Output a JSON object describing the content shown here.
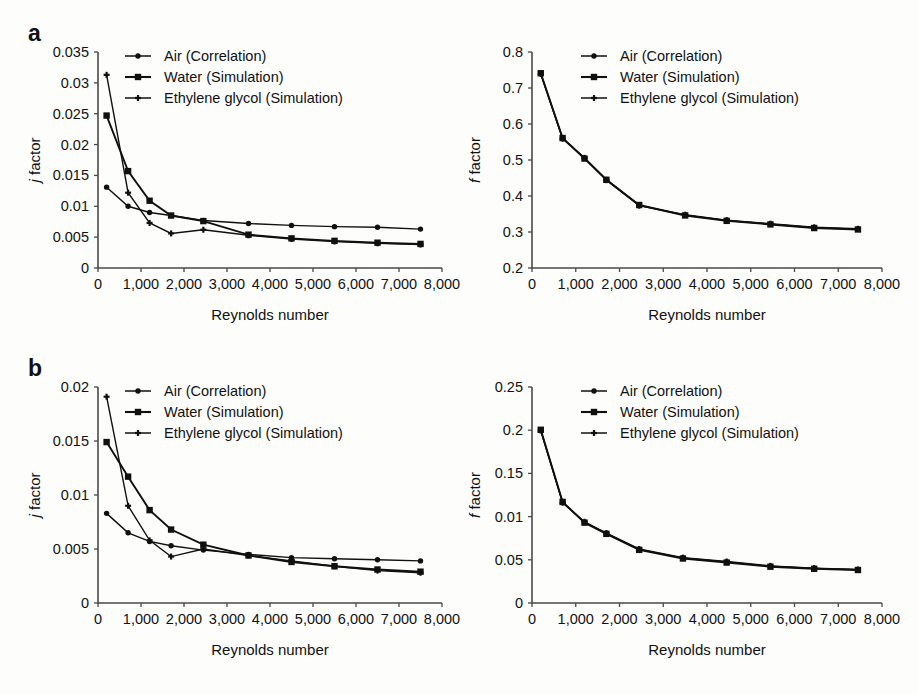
{
  "figure": {
    "background": "#fdfdfc",
    "ink_color": "#101010",
    "panels": [
      {
        "letter": "a",
        "charts": [
          "a_left",
          "a_right"
        ]
      },
      {
        "letter": "b",
        "charts": [
          "b_left",
          "b_right"
        ]
      }
    ]
  },
  "legend_labels": {
    "air": "Air (Correlation)",
    "water": "Water (Simulation)",
    "ethylene": "Ethylene glycol (Simulation)"
  },
  "axis_labels": {
    "x": "Reynolds number",
    "y_j_italic": "j",
    "y_j_rest": " factor",
    "y_f_italic": "f",
    "y_f_rest": " factor"
  },
  "chart_data": [
    {
      "id": "a_left",
      "panel": "a",
      "type": "line",
      "title": "",
      "xlabel": "Reynolds number",
      "ylabel": "j factor",
      "xlim": [
        0,
        8000
      ],
      "ylim": [
        0,
        0.035
      ],
      "xticks": [
        0,
        1000,
        2000,
        3000,
        4000,
        5000,
        6000,
        7000,
        8000
      ],
      "xticklabels": [
        "0",
        "1,000",
        "2,000",
        "3,000",
        "4,000",
        "5,000",
        "6,000",
        "7,000",
        "8,000"
      ],
      "yticks": [
        0,
        0.005,
        0.01,
        0.015,
        0.02,
        0.025,
        0.03,
        0.035
      ],
      "yticklabels": [
        "0",
        "0.005",
        "0.01",
        "0.015",
        "0.02",
        "0.025",
        "0.03",
        "0.035"
      ],
      "grid": false,
      "legend_position": "top-center",
      "x": [
        200,
        700,
        1200,
        1700,
        2450,
        3500,
        4500,
        5500,
        6500,
        7500
      ],
      "series": [
        {
          "name": "Air (Correlation)",
          "marker": "diamond",
          "values": [
            0.0131,
            0.01,
            0.009,
            0.0085,
            0.0077,
            0.0072,
            0.0069,
            0.0067,
            0.0066,
            0.0063
          ]
        },
        {
          "name": "Water (Simulation)",
          "marker": "square",
          "values": [
            0.0247,
            0.0157,
            0.0109,
            0.0085,
            0.0076,
            0.0054,
            0.0048,
            0.0044,
            0.0041,
            0.0039
          ]
        },
        {
          "name": "Ethylene glycol (Simulation)",
          "marker": "cross",
          "values": [
            0.0313,
            0.0122,
            0.0073,
            0.0056,
            0.0062,
            0.0053,
            0.0047,
            0.0043,
            0.004,
            0.0038
          ]
        }
      ]
    },
    {
      "id": "a_right",
      "panel": "a",
      "type": "line",
      "title": "",
      "xlabel": "Reynolds number",
      "ylabel": "f factor",
      "xlim": [
        0,
        8000
      ],
      "ylim": [
        0.2,
        0.8
      ],
      "xticks": [
        0,
        1000,
        2000,
        3000,
        4000,
        5000,
        6000,
        7000,
        8000
      ],
      "xticklabels": [
        "0",
        "1,000",
        "2,000",
        "3,000",
        "4,000",
        "5,000",
        "6,000",
        "7,000",
        "8,000"
      ],
      "yticks": [
        0.2,
        0.3,
        0.4,
        0.5,
        0.6,
        0.7,
        0.8
      ],
      "yticklabels": [
        "0.2",
        "0.3",
        "0.4",
        "0.5",
        "0.6",
        "0.7",
        "0.8"
      ],
      "grid": false,
      "legend_position": "top-center",
      "x": [
        200,
        700,
        1200,
        1700,
        2450,
        3500,
        4450,
        5450,
        6450,
        7450
      ],
      "series": [
        {
          "name": "Air (Correlation)",
          "marker": "diamond",
          "values": [
            0.74,
            0.56,
            0.505,
            0.446,
            0.374,
            0.347,
            0.332,
            0.322,
            0.312,
            0.308
          ]
        },
        {
          "name": "Water (Simulation)",
          "marker": "square",
          "values": [
            0.741,
            0.561,
            0.504,
            0.445,
            0.375,
            0.346,
            0.331,
            0.321,
            0.311,
            0.307
          ]
        },
        {
          "name": "Ethylene glycol (Simulation)",
          "marker": "cross",
          "values": [
            0.739,
            0.559,
            0.506,
            0.444,
            0.373,
            0.348,
            0.333,
            0.323,
            0.313,
            0.309
          ]
        }
      ]
    },
    {
      "id": "b_left",
      "panel": "b",
      "type": "line",
      "title": "",
      "xlabel": "Reynolds number",
      "ylabel": "j factor",
      "xlim": [
        0,
        8000
      ],
      "ylim": [
        0,
        0.02
      ],
      "xticks": [
        0,
        1000,
        2000,
        3000,
        4000,
        5000,
        6000,
        7000,
        8000
      ],
      "xticklabels": [
        "0",
        "1,000",
        "2,000",
        "3,000",
        "4,000",
        "5,000",
        "6,000",
        "7,000",
        "8,000"
      ],
      "yticks": [
        0,
        0.005,
        0.01,
        0.015,
        0.02
      ],
      "yticklabels": [
        "0",
        "0.005",
        "0.01",
        "0.015",
        "0.02"
      ],
      "grid": false,
      "legend_position": "top-center",
      "x": [
        200,
        700,
        1200,
        1700,
        2450,
        3500,
        4500,
        5500,
        6500,
        7500
      ],
      "series": [
        {
          "name": "Air (Correlation)",
          "marker": "diamond",
          "values": [
            0.0083,
            0.0065,
            0.0057,
            0.0053,
            0.0049,
            0.0045,
            0.0042,
            0.0041,
            0.004,
            0.0039
          ]
        },
        {
          "name": "Water (Simulation)",
          "marker": "square",
          "values": [
            0.0149,
            0.0117,
            0.0086,
            0.0068,
            0.0054,
            0.0044,
            0.0038,
            0.0034,
            0.0031,
            0.0029
          ]
        },
        {
          "name": "Ethylene glycol (Simulation)",
          "marker": "cross",
          "values": [
            0.0191,
            0.009,
            0.0058,
            0.0043,
            0.005,
            0.0044,
            0.0039,
            0.0034,
            0.003,
            0.0028
          ]
        }
      ]
    },
    {
      "id": "b_right",
      "panel": "b",
      "type": "line",
      "title": "",
      "xlabel": "Reynolds number",
      "ylabel": "f factor",
      "xlim": [
        0,
        8000
      ],
      "ylim": [
        0,
        0.25
      ],
      "xticks": [
        0,
        1000,
        2000,
        3000,
        4000,
        5000,
        6000,
        7000,
        8000
      ],
      "xticklabels": [
        "0",
        "1,000",
        "2,000",
        "3,000",
        "4,000",
        "5,000",
        "6,000",
        "7,000",
        "8,000"
      ],
      "yticks": [
        0,
        0.05,
        0.1,
        0.15,
        0.2,
        0.25
      ],
      "yticklabels": [
        "0",
        "0.05",
        "0.01",
        "0.15",
        "0.2",
        "0.25"
      ],
      "grid": false,
      "legend_position": "top-center",
      "x": [
        200,
        700,
        1200,
        1700,
        2450,
        3450,
        4450,
        5450,
        6450,
        7450
      ],
      "series": [
        {
          "name": "Air (Correlation)",
          "marker": "diamond",
          "values": [
            0.2,
            0.1165,
            0.0935,
            0.0805,
            0.062,
            0.052,
            0.0475,
            0.0425,
            0.04,
            0.0385
          ]
        },
        {
          "name": "Water (Simulation)",
          "marker": "square",
          "values": [
            0.2005,
            0.117,
            0.093,
            0.08,
            0.0615,
            0.0515,
            0.0468,
            0.042,
            0.0396,
            0.0382
          ]
        },
        {
          "name": "Ethylene glycol (Simulation)",
          "marker": "cross",
          "values": [
            0.1995,
            0.116,
            0.094,
            0.081,
            0.0625,
            0.0525,
            0.048,
            0.043,
            0.0404,
            0.0388
          ]
        }
      ]
    }
  ]
}
